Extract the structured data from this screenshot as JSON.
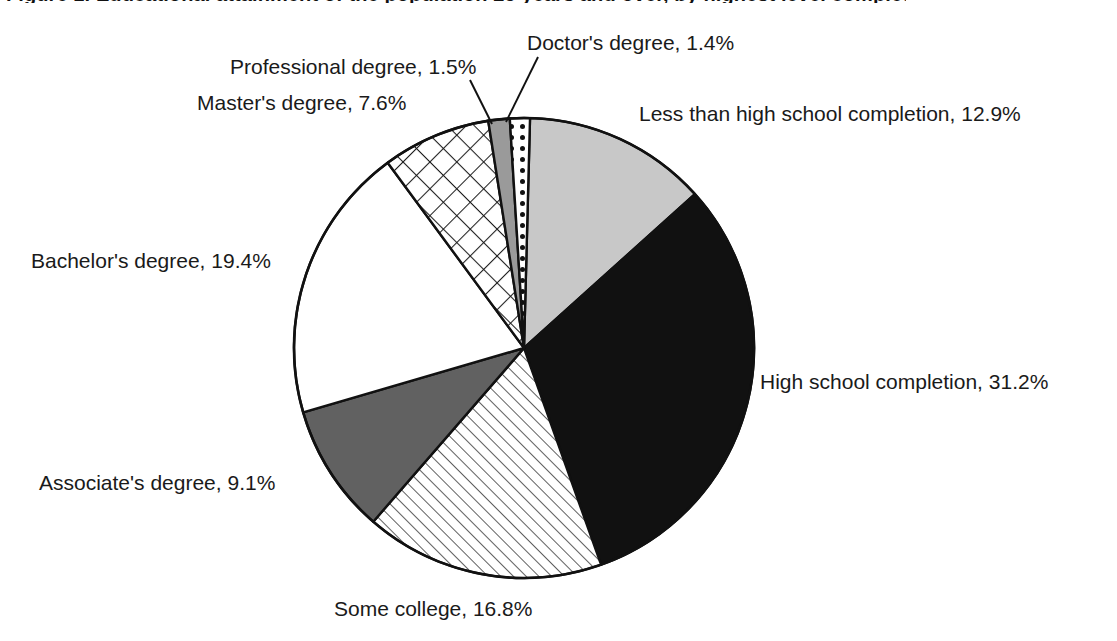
{
  "figure": {
    "title": "Figure 1. Educational attainment of the population 25 years and over, by highest level completed",
    "title_clipped": true
  },
  "chart_data": {
    "type": "pie",
    "title": "Educational attainment of the population 25 years and over, by highest level completed",
    "xlabel": "",
    "ylabel": "",
    "units": "percent",
    "legend_position": "callout-labels",
    "grid": false,
    "start_angle_deg": -88.5,
    "direction": "clockwise",
    "categories": [
      "Less than high school completion",
      "High school completion",
      "Some college",
      "Associate's degree",
      "Bachelor's degree",
      "Master's degree",
      "Professional degree",
      "Doctor's degree"
    ],
    "values": [
      12.9,
      31.2,
      16.8,
      9.1,
      19.4,
      7.6,
      1.5,
      1.4
    ],
    "slices": [
      {
        "label": "Less than high school completion",
        "value": 12.9,
        "value_text": "12.9%",
        "callout": "Less than high school completion, 12.9%",
        "fill": "light-gray-solid",
        "color": "#c8c8c8"
      },
      {
        "label": "High school completion",
        "value": 31.2,
        "value_text": "31.2%",
        "callout": "High school completion, 31.2%",
        "fill": "black-solid",
        "color": "#111111"
      },
      {
        "label": "Some college",
        "value": 16.8,
        "value_text": "16.8%",
        "callout": "Some college, 16.8%",
        "fill": "diagonal-hatch",
        "color": "#ffffff"
      },
      {
        "label": "Associate's degree",
        "value": 9.1,
        "value_text": "9.1%",
        "callout": "Associate's degree, 9.1%",
        "fill": "dark-gray-solid",
        "color": "#616161"
      },
      {
        "label": "Bachelor's degree",
        "value": 19.4,
        "value_text": "19.4%",
        "callout": "Bachelor's degree, 19.4%",
        "fill": "white-solid",
        "color": "#ffffff"
      },
      {
        "label": "Master's degree",
        "value": 7.6,
        "value_text": "7.6%",
        "callout": "Master's degree, 7.6%",
        "fill": "cross-hatch",
        "color": "#ffffff"
      },
      {
        "label": "Professional degree",
        "value": 1.5,
        "value_text": "1.5%",
        "callout": "Professional degree, 1.5%",
        "fill": "mid-gray-solid",
        "color": "#9a9a9a"
      },
      {
        "label": "Doctor's degree",
        "value": 1.4,
        "value_text": "1.4%",
        "callout": "Doctor's degree, 1.4%",
        "fill": "dotted",
        "color": "#ffffff"
      }
    ],
    "colors": {
      "outline": "#111111",
      "light_gray": "#c8c8c8",
      "mid_gray": "#9a9a9a",
      "dark_gray": "#616161",
      "black": "#111111",
      "white": "#ffffff",
      "text": "#1a1a1a"
    }
  },
  "labels": {
    "doctors": "Doctor's degree, 1.4%",
    "professional": "Professional degree, 1.5%",
    "masters": "Master's degree, 7.6%",
    "less_than_hs": "Less than high school completion, 12.9%",
    "bachelors": "Bachelor's degree, 19.4%",
    "high_school": "High school completion, 31.2%",
    "associates": "Associate's degree, 9.1%",
    "some_college": "Some college, 16.8%"
  }
}
